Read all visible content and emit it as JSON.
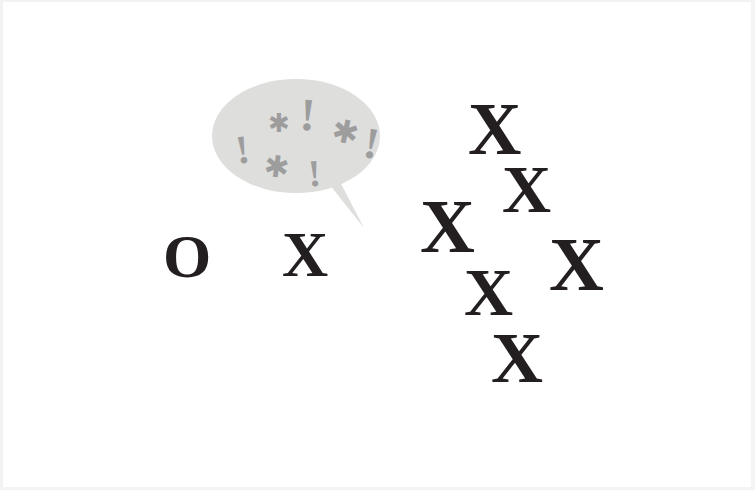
{
  "scene": {
    "title": "Censored speech illustration",
    "background_color": "#ffffff"
  },
  "colors": {
    "letter": "#231f20",
    "bubble_fill": "#dededd",
    "bubble_fill_light": "#e4e4e3",
    "grawlix": "#9d9d9d",
    "page_edge": "#f2f2f2"
  },
  "letters": {
    "left_group": [
      {
        "name": "letter-o",
        "char": "O",
        "x": 163,
        "y": 225,
        "size": 62
      },
      {
        "name": "letter-x-left",
        "char": "X",
        "x": 282,
        "y": 223,
        "size": 64
      }
    ],
    "right_cluster": [
      {
        "name": "letter-x-1",
        "char": "X",
        "x": 468,
        "y": 92,
        "size": 74
      },
      {
        "name": "letter-x-2",
        "char": "X",
        "x": 502,
        "y": 155,
        "size": 68
      },
      {
        "name": "letter-x-3",
        "char": "X",
        "x": 420,
        "y": 188,
        "size": 76
      },
      {
        "name": "letter-x-4",
        "char": "X",
        "x": 549,
        "y": 226,
        "size": 76
      },
      {
        "name": "letter-x-5",
        "char": "X",
        "x": 464,
        "y": 258,
        "size": 68
      },
      {
        "name": "letter-x-6",
        "char": "X",
        "x": 491,
        "y": 322,
        "size": 72
      }
    ]
  },
  "speech_bubble": {
    "name": "speech-bubble",
    "shape": "ellipse-with-tail",
    "fill": "#dededd",
    "ellipse": {
      "cx": 84,
      "cy": 58,
      "rx": 84,
      "ry": 57
    },
    "tail_points": "108,96 150,148 128,104",
    "grawlix_symbols": [
      {
        "name": "grawlix-bang-1",
        "char": "!",
        "x": 24,
        "y": 52,
        "size": 40,
        "rotate": -8
      },
      {
        "name": "grawlix-asterisk-1",
        "char": "✱",
        "x": 56,
        "y": 32,
        "size": 26,
        "rotate": 0
      },
      {
        "name": "grawlix-bang-2",
        "char": "!",
        "x": 88,
        "y": 14,
        "size": 46,
        "rotate": 4
      },
      {
        "name": "grawlix-asterisk-2",
        "char": "✱",
        "x": 120,
        "y": 38,
        "size": 32,
        "rotate": 12
      },
      {
        "name": "grawlix-bang-3",
        "char": "!",
        "x": 152,
        "y": 44,
        "size": 44,
        "rotate": 10
      },
      {
        "name": "grawlix-asterisk-3",
        "char": "✱",
        "x": 52,
        "y": 74,
        "size": 30,
        "rotate": 8
      },
      {
        "name": "grawlix-bang-4",
        "char": "!",
        "x": 96,
        "y": 76,
        "size": 38,
        "rotate": -4
      }
    ]
  }
}
